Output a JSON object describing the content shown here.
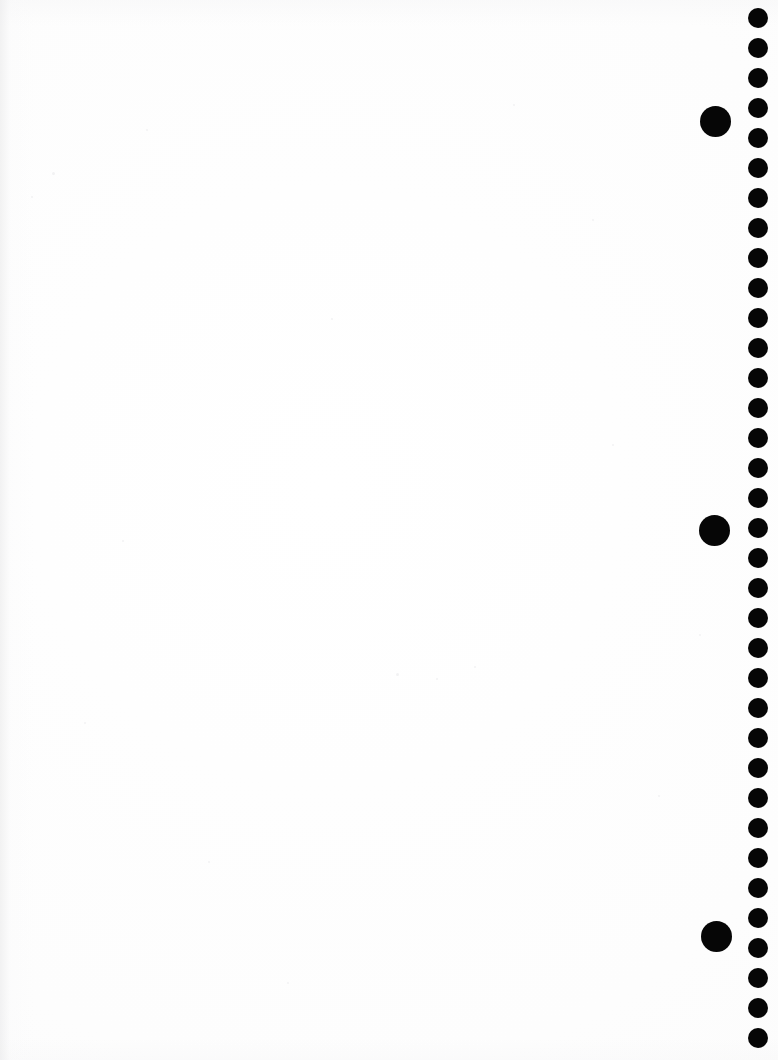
{
  "page": {
    "width": 778,
    "height": 1060,
    "background_color": "#fefefe",
    "paper_tone": "#fdfdfd",
    "mark_color": "#060606"
  },
  "marks": {
    "rail": {
      "name": "dot-rail",
      "count": 35,
      "diameter": 20,
      "center_x": 758,
      "first_center_y": 18,
      "spacing_y": 30,
      "color": "#060606"
    },
    "large_dots": [
      {
        "label": "large-dot-1",
        "center_x": 715,
        "center_y": 121,
        "diameter": 31,
        "color": "#060606"
      },
      {
        "label": "large-dot-2",
        "center_x": 714,
        "center_y": 530,
        "diameter": 31,
        "color": "#060606"
      },
      {
        "label": "large-dot-3",
        "center_x": 716,
        "center_y": 936,
        "diameter": 31,
        "color": "#060606"
      }
    ]
  },
  "specks": [
    {
      "x": 52,
      "y": 172,
      "size": 3
    },
    {
      "x": 31,
      "y": 196,
      "size": 2
    },
    {
      "x": 146,
      "y": 129,
      "size": 2
    },
    {
      "x": 396,
      "y": 673,
      "size": 3
    },
    {
      "x": 436,
      "y": 678,
      "size": 2
    },
    {
      "x": 474,
      "y": 666,
      "size": 2
    },
    {
      "x": 612,
      "y": 444,
      "size": 2
    },
    {
      "x": 208,
      "y": 861,
      "size": 2
    },
    {
      "x": 331,
      "y": 318,
      "size": 2
    },
    {
      "x": 658,
      "y": 795,
      "size": 2
    },
    {
      "x": 592,
      "y": 219,
      "size": 2
    },
    {
      "x": 122,
      "y": 540,
      "size": 2
    },
    {
      "x": 287,
      "y": 982,
      "size": 2
    },
    {
      "x": 513,
      "y": 104,
      "size": 2
    },
    {
      "x": 699,
      "y": 634,
      "size": 2
    },
    {
      "x": 84,
      "y": 722,
      "size": 2
    }
  ]
}
